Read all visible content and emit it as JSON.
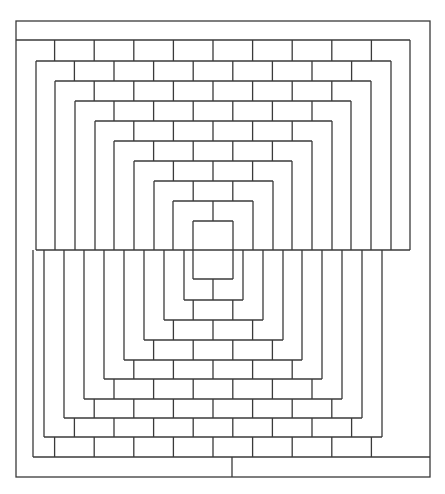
{
  "diagram": {
    "stroke_color": "#3a3a3a",
    "background": "#ffffff",
    "outer_rect": {
      "x1": 16,
      "y1": 21,
      "x2": 430,
      "y2": 477
    },
    "top_band_line": {
      "y": 40,
      "x1": 16,
      "x2": 410,
      "right_drop_to": 250
    },
    "bottom_band_line": {
      "y": 457,
      "x1": 33,
      "x2": 430,
      "left_rise_to": 250,
      "divider_x": 232
    },
    "seam": {
      "y": 250,
      "x1": 36,
      "x2": 410
    },
    "upper_u": [
      {
        "y": 61,
        "left": 36,
        "right": 391
      },
      {
        "y": 81,
        "left": 55,
        "right": 371
      },
      {
        "y": 101,
        "left": 75,
        "right": 351
      },
      {
        "y": 121,
        "left": 95,
        "right": 332
      },
      {
        "y": 141,
        "left": 114,
        "right": 312
      },
      {
        "y": 161,
        "left": 134,
        "right": 292
      },
      {
        "y": 181,
        "left": 154,
        "right": 273
      },
      {
        "y": 201,
        "left": 173,
        "right": 253
      }
    ],
    "lower_u": [
      {
        "y": 437,
        "left": 44,
        "right": 382
      },
      {
        "y": 418,
        "left": 64,
        "right": 362
      },
      {
        "y": 399,
        "left": 84,
        "right": 342
      },
      {
        "y": 379,
        "left": 104,
        "right": 322
      },
      {
        "y": 360,
        "left": 124,
        "right": 302
      },
      {
        "y": 340,
        "left": 144,
        "right": 283
      },
      {
        "y": 320,
        "left": 164,
        "right": 263
      },
      {
        "y": 300,
        "left": 184,
        "right": 243
      }
    ],
    "inner_rect": {
      "x1": 193,
      "y1": 221,
      "x2": 233,
      "y2": 279
    },
    "brick": {
      "center_x": 213,
      "half_step": 19.8
    }
  }
}
